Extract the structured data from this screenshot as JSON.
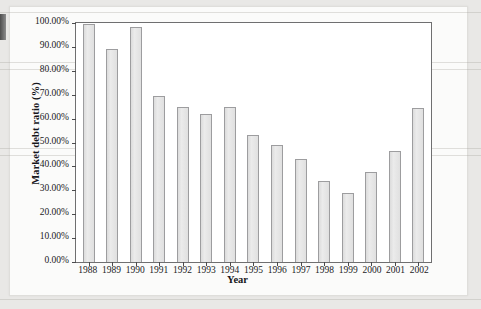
{
  "chart_data": {
    "type": "bar",
    "title": "",
    "xlabel": "Year",
    "ylabel": "Market debt ratio (%)",
    "categories": [
      "1988",
      "1989",
      "1990",
      "1991",
      "1992",
      "1993",
      "1994",
      "1995",
      "1996",
      "1997",
      "1998",
      "1999",
      "2000",
      "2001",
      "2002"
    ],
    "values": [
      99.5,
      89.0,
      98.5,
      69.5,
      65.0,
      62.0,
      65.0,
      53.0,
      49.0,
      43.0,
      34.0,
      29.0,
      37.5,
      46.5,
      64.5
    ],
    "ylim": [
      0,
      100
    ],
    "ytick_values": [
      100,
      90,
      80,
      70,
      60,
      50,
      40,
      30,
      20,
      10,
      0
    ],
    "ytick_labels": [
      "100.00%",
      "90.00%",
      "80.00%",
      "70.00%",
      "60.00%",
      "50.00%",
      "40.00%",
      "30.00%",
      "20.00%",
      "10.00%",
      "0.00%"
    ],
    "grid": false,
    "legend": null,
    "bar_fill_color": "#e3e3e3",
    "bar_border_color": "#9d9d9f",
    "axis_color": "#6f6f70",
    "plot_background": "#ffffff",
    "page_background": "#fbfbfa"
  }
}
